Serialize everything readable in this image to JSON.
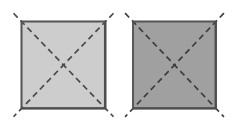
{
  "figure": {
    "title": "",
    "background_color": "#ffffff",
    "width": 232,
    "height": 122,
    "panel_count": 2
  },
  "panels": [
    {
      "id": "left-panel",
      "label": "",
      "fill_color": "#cdcdcd",
      "border_color": "#555555",
      "border_width": 1.6,
      "x": 21.5,
      "y": 21.5,
      "width": 84,
      "height": 87,
      "center_x": 63.5,
      "center_y": 65,
      "diagonal": {
        "style": "dashed",
        "color": "#4a4a4a",
        "width": 1.7,
        "dash_length": 6,
        "gap_length": 4,
        "overhang": 11.5
      }
    },
    {
      "id": "right-panel",
      "label": "",
      "fill_color": "#a0a0a0",
      "border_color": "#555555",
      "border_width": 1.6,
      "x": 133,
      "y": 21.5,
      "width": 83,
      "height": 87,
      "center_x": 174.5,
      "center_y": 65,
      "diagonal": {
        "style": "dashed",
        "color": "#3d3d3d",
        "width": 1.7,
        "dash_length": 6,
        "gap_length": 4,
        "overhang": 11.5
      }
    }
  ]
}
